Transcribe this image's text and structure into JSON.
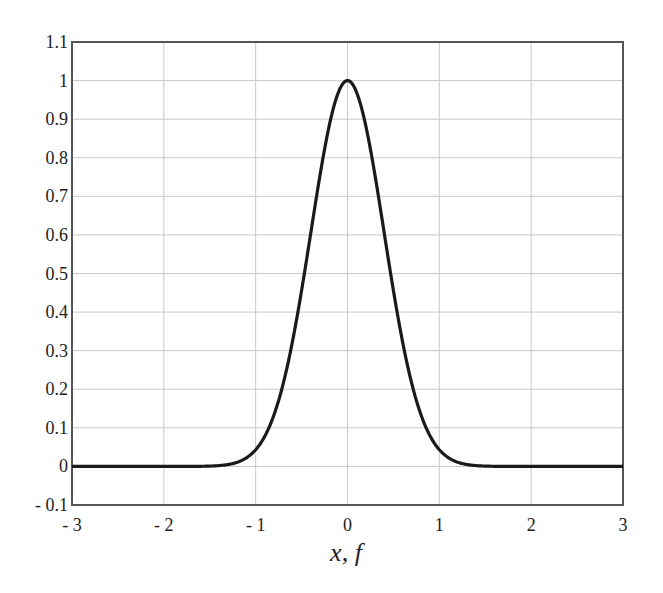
{
  "chart_data": {
    "type": "line",
    "title": "",
    "xlabel": "x, f",
    "ylabel": "",
    "xlim": [
      -3,
      3
    ],
    "ylim": [
      -0.1,
      1.1
    ],
    "grid": true,
    "legend": null,
    "x_ticks": [
      -3,
      -2,
      -1,
      0,
      1,
      2,
      3
    ],
    "x_tick_labels": [
      "- 3",
      "- 2",
      "- 1",
      "0",
      "1",
      "2",
      "3"
    ],
    "y_ticks": [
      -0.1,
      0,
      0.1,
      0.2,
      0.3,
      0.4,
      0.5,
      0.6,
      0.7,
      0.8,
      0.9,
      1,
      1.1
    ],
    "y_tick_labels": [
      "- 0.1",
      "0",
      "0.1",
      "0.2",
      "0.3",
      "0.4",
      "0.5",
      "0.6",
      "0.7",
      "0.8",
      "0.9",
      "1",
      "1.1"
    ],
    "series": [
      {
        "name": "f(x)",
        "description": "Gaussian bell curve, peak 1 at x=0",
        "x": [
          -3,
          -2,
          -1.5,
          -1.25,
          -1,
          -0.75,
          -0.5,
          -0.4,
          -0.3,
          -0.2,
          -0.1,
          0,
          0.1,
          0.2,
          0.3,
          0.4,
          0.5,
          0.75,
          1,
          1.25,
          1.5,
          2,
          3
        ],
        "y": [
          0,
          0,
          0.001,
          0.007,
          0.043,
          0.171,
          0.456,
          0.605,
          0.754,
          0.882,
          0.969,
          1,
          0.969,
          0.882,
          0.754,
          0.605,
          0.456,
          0.171,
          0.043,
          0.007,
          0.001,
          0,
          0
        ],
        "color": "#1a1a1a"
      }
    ]
  },
  "colors": {
    "curve": "#1a1a1a",
    "grid": "#c8c8c8",
    "frame": "#555555"
  }
}
